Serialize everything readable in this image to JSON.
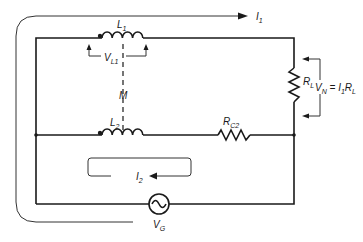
{
  "diagram": {
    "title": "",
    "labels": {
      "I1": "I",
      "I1_sub": "1",
      "L1": "L",
      "L1_sub": "1",
      "VL1": "V",
      "VL1_sub": "L1",
      "M": "M",
      "L2": "L",
      "L2_sub": "2",
      "RC2": "R",
      "RC2_sub": "C2",
      "RL": "R",
      "RL_sub": "L",
      "VN_eq": "V",
      "VN_sub": "N",
      "VN_rhs": " = I",
      "VN_rhs_sub1": "1",
      "VN_rhs_tail": "R",
      "VN_rhs_sub2": "L",
      "I2": "I",
      "I2_sub": "2",
      "VG": "V",
      "VG_sub": "G"
    },
    "components": [
      {
        "id": "L1",
        "type": "inductor",
        "branch": "top"
      },
      {
        "id": "L2",
        "type": "inductor",
        "branch": "middle"
      },
      {
        "id": "M",
        "type": "mutual-coupling",
        "between": [
          "L1",
          "L2"
        ]
      },
      {
        "id": "RL",
        "type": "resistor",
        "branch": "right"
      },
      {
        "id": "RC2",
        "type": "resistor",
        "branch": "middle"
      },
      {
        "id": "VG",
        "type": "ac-source",
        "branch": "bottom"
      }
    ],
    "colors": {
      "ink": "#1a1a1a",
      "background": "#ffffff"
    }
  }
}
